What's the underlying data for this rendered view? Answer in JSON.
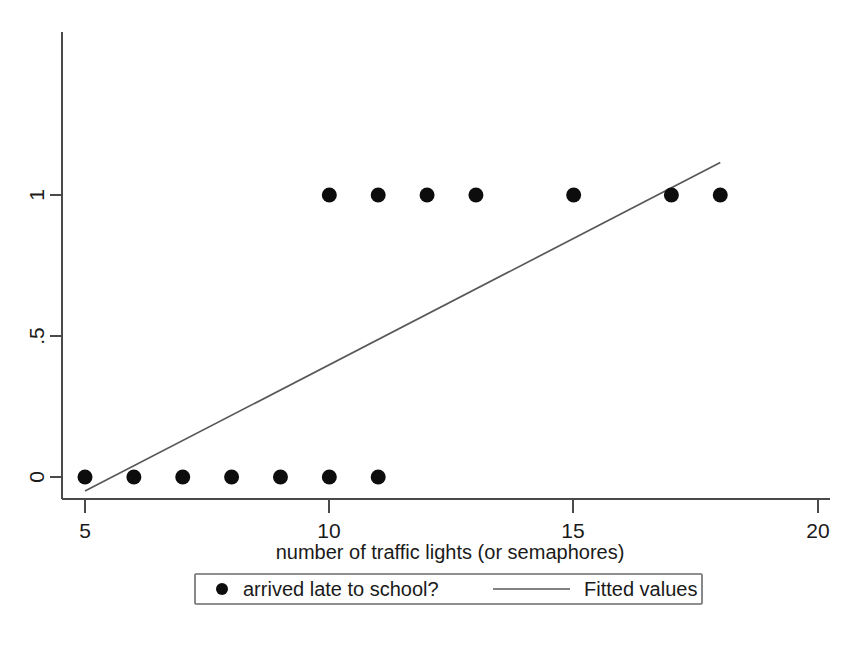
{
  "chart_data": {
    "type": "scatter",
    "title": "",
    "xlabel": "number of traffic lights (or semaphores)",
    "ylabel": "",
    "xlim": [
      4.55,
      20.5
    ],
    "ylim": [
      -0.085,
      1.165
    ],
    "grid": false,
    "xticks": [
      5,
      10,
      15,
      20
    ],
    "xtick_labels": [
      "5",
      "10",
      "15",
      "20"
    ],
    "yticks": [
      0,
      0.5,
      1
    ],
    "ytick_labels": [
      "0",
      ".5",
      "1"
    ],
    "legend_position": "below-axes",
    "series": [
      {
        "name": "arrived late to school?",
        "type": "scatter",
        "marker": "filled-circle",
        "color": "#0d0d0d",
        "points": [
          {
            "x": 5,
            "y": 0
          },
          {
            "x": 6,
            "y": 0
          },
          {
            "x": 7,
            "y": 0
          },
          {
            "x": 8,
            "y": 0
          },
          {
            "x": 9,
            "y": 0
          },
          {
            "x": 10,
            "y": 0
          },
          {
            "x": 11,
            "y": 0
          },
          {
            "x": 10,
            "y": 1
          },
          {
            "x": 11,
            "y": 1
          },
          {
            "x": 12,
            "y": 1
          },
          {
            "x": 13,
            "y": 1
          },
          {
            "x": 15,
            "y": 1
          },
          {
            "x": 17,
            "y": 1
          },
          {
            "x": 18,
            "y": 1
          }
        ]
      },
      {
        "name": "Fitted values",
        "type": "line",
        "color": "#585858",
        "endpoints": [
          {
            "x": 5.0,
            "y": -0.05
          },
          {
            "x": 18.0,
            "y": 1.115
          }
        ],
        "slope": 0.0896,
        "intercept": -0.498
      }
    ]
  },
  "axis": {
    "x_label": "number of traffic lights (or semaphores)",
    "x_tick_labels": [
      "5",
      "10",
      "15",
      "20"
    ],
    "y_tick_labels": [
      "1",
      ".5",
      "0"
    ]
  },
  "legend": {
    "items": [
      {
        "label": "arrived late to school?",
        "marker": "filled-circle"
      },
      {
        "label": "Fitted values",
        "marker": "line"
      }
    ]
  }
}
